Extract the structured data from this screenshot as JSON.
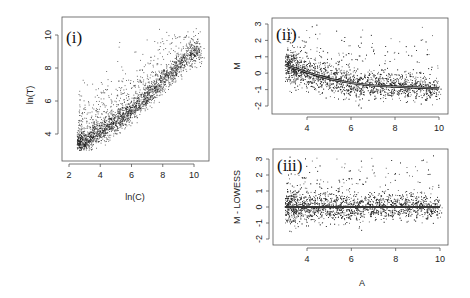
{
  "chart_data": [
    {
      "id": "panel-i",
      "type": "scatter",
      "panel_label": "(i)",
      "title": "",
      "xlabel": "ln(C)",
      "ylabel": "ln(T)",
      "xlim": [
        1.6,
        10.8
      ],
      "ylim": [
        2.5,
        11
      ],
      "xticks": [
        2,
        4,
        6,
        8,
        10
      ],
      "yticks": [
        4,
        6,
        8,
        10
      ],
      "grid": false,
      "legend": "none",
      "n_points_approx": 8000,
      "point_cloud": {
        "description": "dense positively correlated cloud along ln(T) ≈ 0.9·ln(C) + 0.9 with upper-left spread of outliers",
        "x_range": [
          2.5,
          10.5
        ],
        "y_range": [
          3,
          10.5
        ],
        "trend": [
          [
            3,
            3.5
          ],
          [
            4,
            4.2
          ],
          [
            5,
            4.8
          ],
          [
            6,
            5.5
          ],
          [
            7,
            6.3
          ],
          [
            8,
            7.2
          ],
          [
            9,
            8.2
          ],
          [
            10,
            9.0
          ]
        ]
      }
    },
    {
      "id": "panel-ii",
      "type": "scatter",
      "panel_label": "(ii)",
      "title": "",
      "xlabel": "",
      "ylabel": "M",
      "xlim": [
        2.6,
        10.4
      ],
      "ylim": [
        -2.5,
        3.4
      ],
      "xticks": [
        4,
        6,
        8,
        10
      ],
      "yticks": [
        -2,
        -1,
        0,
        1,
        2,
        3
      ],
      "grid": false,
      "legend": "none",
      "n_points_approx": 8000,
      "lowess_curve": {
        "x": [
          3.0,
          4.0,
          5.0,
          6.0,
          7.0,
          8.0,
          9.0,
          10.0
        ],
        "y": [
          0.5,
          0.05,
          -0.35,
          -0.6,
          -0.75,
          -0.82,
          -0.88,
          -0.92
        ]
      },
      "point_cloud": {
        "description": "MA-plot cloud following the lowess curve with upward tail of outliers at high M",
        "x_range": [
          3,
          10
        ],
        "y_range": [
          -2.3,
          3.1
        ]
      }
    },
    {
      "id": "panel-iii",
      "type": "scatter",
      "panel_label": "(iii)",
      "title": "",
      "xlabel": "A",
      "ylabel": "M - LOWESS",
      "xlim": [
        2.6,
        10.4
      ],
      "ylim": [
        -2.5,
        3.4
      ],
      "xticks": [
        4,
        6,
        8,
        10
      ],
      "yticks": [
        -2,
        -1,
        0,
        1,
        2,
        3
      ],
      "grid": false,
      "legend": "none",
      "n_points_approx": 8000,
      "reference_line": {
        "x": [
          3.0,
          10.0
        ],
        "y": [
          0,
          0
        ]
      },
      "point_cloud": {
        "description": "normalized MA-plot cloud centered at 0 with upward tail of outliers",
        "x_range": [
          3,
          10
        ],
        "y_range": [
          -2.2,
          3.3
        ]
      }
    }
  ]
}
